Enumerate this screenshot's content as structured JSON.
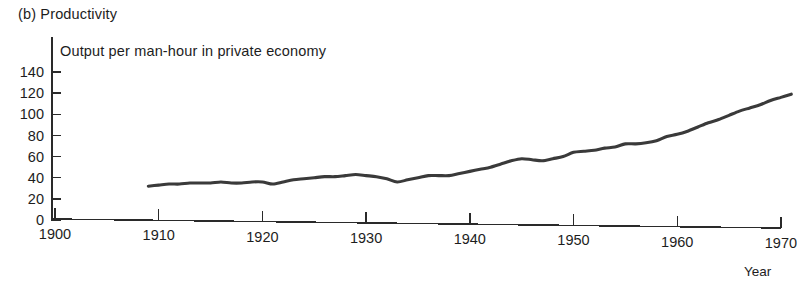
{
  "figure": {
    "panel_caption": "(b) Productivity",
    "series_label": "Output per man-hour in private economy",
    "xaxis_label": "Year",
    "line_color": "#3a3a3a",
    "axis_color": "#2a2a2a",
    "background_color": "#ffffff"
  },
  "chart_data": {
    "type": "line",
    "title": "(b) Productivity",
    "subtitle": "Output per man-hour in private economy",
    "xlabel": "Year",
    "ylabel": "",
    "xlim": [
      1900,
      1970
    ],
    "ylim": [
      0,
      140
    ],
    "grid": false,
    "legend": "none",
    "xticks": [
      1900,
      1910,
      1920,
      1930,
      1940,
      1950,
      1960,
      1970
    ],
    "xtick_labels": [
      "1900",
      "1910",
      "1920",
      "1930",
      "1940",
      "1950",
      "1960",
      "1970"
    ],
    "yticks": [
      0,
      20,
      40,
      60,
      80,
      100,
      120,
      140
    ],
    "ytick_labels": [
      "0",
      "20",
      "40",
      "60",
      "80",
      "100",
      "120",
      "140"
    ],
    "series": [
      {
        "name": "Output per man-hour in private economy",
        "color": "#3a3a3a",
        "x": [
          1909,
          1910,
          1911,
          1912,
          1913,
          1914,
          1915,
          1916,
          1917,
          1918,
          1919,
          1920,
          1921,
          1922,
          1923,
          1924,
          1925,
          1926,
          1927,
          1928,
          1929,
          1930,
          1931,
          1932,
          1933,
          1934,
          1935,
          1936,
          1937,
          1938,
          1939,
          1940,
          1941,
          1942,
          1943,
          1944,
          1945,
          1946,
          1947,
          1948,
          1949,
          1950,
          1951,
          1952,
          1953,
          1954,
          1955,
          1956,
          1957,
          1958,
          1959,
          1960,
          1961,
          1962,
          1963,
          1964,
          1965,
          1966,
          1967,
          1968,
          1969,
          1970,
          1971
        ],
        "y": [
          32,
          33,
          34,
          34,
          35,
          35,
          35,
          36,
          35,
          35,
          36,
          36,
          34,
          36,
          38,
          39,
          40,
          41,
          41,
          42,
          43,
          42,
          41,
          39,
          36,
          38,
          40,
          42,
          42,
          42,
          44,
          46,
          48,
          50,
          53,
          56,
          58,
          57,
          56,
          58,
          60,
          64,
          65,
          66,
          68,
          69,
          72,
          72,
          73,
          75,
          79,
          81,
          84,
          88,
          92,
          95,
          99,
          103,
          106,
          109,
          113,
          116,
          119
        ]
      }
    ]
  }
}
